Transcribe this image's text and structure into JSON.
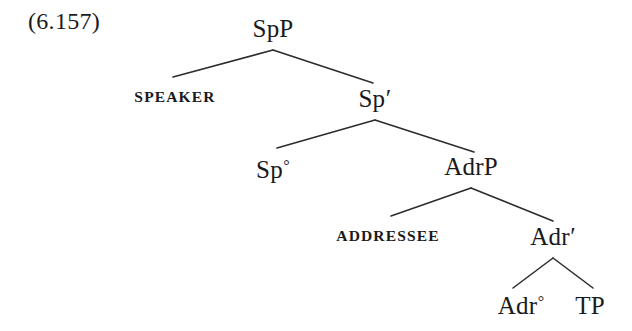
{
  "figure": {
    "example_number": "(6.157)",
    "caption": "",
    "background_color": "#ffffff",
    "line_color": "#2b2b30",
    "text_color": "#1a1a1d"
  },
  "tree": {
    "type": "x-bar-syntax-tree",
    "nodes": {
      "spp": {
        "label": "SpP",
        "x": 273,
        "baseline": 40
      },
      "speaker": {
        "label": "SPEAKER",
        "x": 175,
        "baseline": 105
      },
      "sp_bar": {
        "label": "Sp",
        "prime": "′",
        "x": 375,
        "baseline": 110
      },
      "sp_head": {
        "label": "Sp",
        "ring": "°",
        "x": 273,
        "baseline": 181
      },
      "adrp": {
        "label": "AdrP",
        "x": 471,
        "baseline": 178
      },
      "addressee": {
        "label": "ADDRESSEE",
        "x": 388,
        "baseline": 244
      },
      "adr_bar": {
        "label": "Adr",
        "prime": "′",
        "x": 553,
        "baseline": 248
      },
      "adr_head": {
        "label": "Adr",
        "ring": "°",
        "x": 521,
        "baseline": 317
      },
      "tp": {
        "label": "TP",
        "x": 590,
        "baseline": 317
      }
    },
    "branches": [
      {
        "from": "spp",
        "to": "speaker",
        "x1": 273,
        "y1": 50,
        "x2": 173,
        "y2": 77
      },
      {
        "from": "spp",
        "to": "sp_bar",
        "x1": 273,
        "y1": 50,
        "x2": 373,
        "y2": 83
      },
      {
        "from": "sp_bar",
        "to": "sp_head",
        "x1": 375,
        "y1": 120,
        "x2": 277,
        "y2": 148
      },
      {
        "from": "sp_bar",
        "to": "adrp",
        "x1": 375,
        "y1": 120,
        "x2": 474,
        "y2": 152
      },
      {
        "from": "adrp",
        "to": "addressee",
        "x1": 471,
        "y1": 188,
        "x2": 391,
        "y2": 216
      },
      {
        "from": "adrp",
        "to": "adr_bar",
        "x1": 471,
        "y1": 188,
        "x2": 553,
        "y2": 221
      },
      {
        "from": "adr_bar",
        "to": "adr_head",
        "x1": 553,
        "y1": 258,
        "x2": 513,
        "y2": 288
      },
      {
        "from": "adr_bar",
        "to": "tp",
        "x1": 553,
        "y1": 258,
        "x2": 593,
        "y2": 288
      }
    ],
    "structure_description": [
      "SpP → SPEAKER, Sp′",
      "Sp′ → Sp°, AdrP",
      "AdrP → ADDRESSEE, Adr′",
      "Adr′ → Adr°, TP"
    ]
  }
}
